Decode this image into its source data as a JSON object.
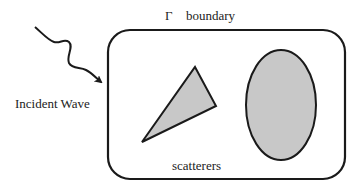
{
  "diagram": {
    "boundary_symbol": "Γ",
    "boundary_label": "boundary",
    "incident_label": "Incident Wave",
    "scatterers_label": "scatterers",
    "colors": {
      "stroke": "#1a1a1a",
      "fill": "#c8c8c8",
      "background": "#ffffff"
    },
    "shapes": [
      {
        "type": "rounded-rectangle",
        "role": "boundary"
      },
      {
        "type": "triangle",
        "role": "scatterer"
      },
      {
        "type": "ellipse",
        "role": "scatterer"
      },
      {
        "type": "wavy-arrow",
        "role": "incident-wave"
      }
    ]
  }
}
